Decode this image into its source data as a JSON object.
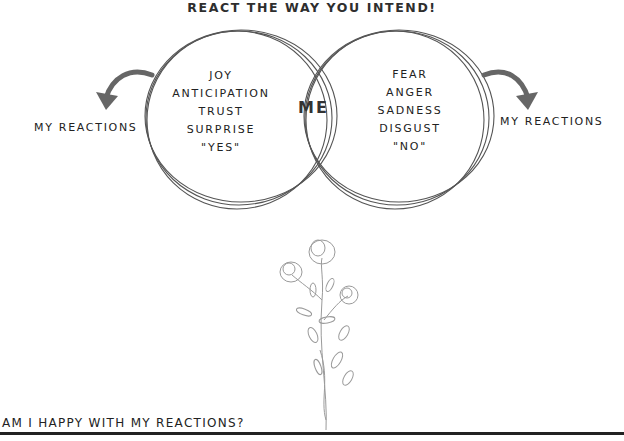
{
  "title": "REACT THE WAY YOU INTEND!",
  "venn": {
    "left_items": [
      "JOY",
      "ANTICIPATION",
      "TRUST",
      "SURPRISE",
      "\"YES\""
    ],
    "right_items": [
      "FEAR",
      "ANGER",
      "SADNESS",
      "DISGUST",
      "\"NO\""
    ],
    "center": "ME"
  },
  "left_label": "MY REACTIONS",
  "right_label": "MY REACTIONS",
  "question": "AM I HAPPY WITH MY REACTIONS?",
  "colors": {
    "ink": "#222222",
    "arrow": "#666666",
    "line_art": "#8a8a8a"
  }
}
